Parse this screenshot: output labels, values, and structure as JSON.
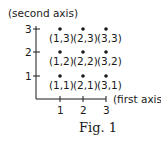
{
  "figure": {
    "caption": "Fig. 1",
    "y_axis_label": "(second axis)",
    "x_axis_label": "(first axis)",
    "x_ticks": [
      "1",
      "2",
      "3"
    ],
    "y_ticks": [
      "1",
      "2",
      "3"
    ],
    "points": [
      {
        "label": "(1,3)",
        "x": 1,
        "y": 3
      },
      {
        "label": "(2,3)",
        "x": 2,
        "y": 3
      },
      {
        "label": "(3,3)",
        "x": 3,
        "y": 3
      },
      {
        "label": "(1,2)",
        "x": 1,
        "y": 2
      },
      {
        "label": "(2,2)",
        "x": 2,
        "y": 2
      },
      {
        "label": "(3,2)",
        "x": 3,
        "y": 2
      },
      {
        "label": "(1,1)",
        "x": 1,
        "y": 1
      },
      {
        "label": "(2,1)",
        "x": 2,
        "y": 1
      },
      {
        "label": "(3,1)",
        "x": 3,
        "y": 1
      }
    ]
  }
}
